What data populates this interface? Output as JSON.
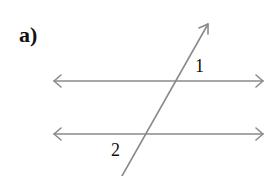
{
  "figure": {
    "part_label": "a)",
    "angle_labels": {
      "angle_1": "1",
      "angle_2": "2"
    },
    "colors": {
      "line": "#8a8a8a",
      "text": "#111111",
      "background": "#ffffff"
    },
    "lines": {
      "parallel_top": {
        "x1": 54,
        "y1": 81,
        "x2": 263,
        "y2": 81,
        "arrows": "both"
      },
      "parallel_bottom": {
        "x1": 54,
        "y1": 134,
        "x2": 263,
        "y2": 134,
        "arrows": "both"
      },
      "transversal": {
        "x1": 122,
        "y1": 176,
        "x2": 208,
        "y2": 24,
        "arrows": "top"
      }
    }
  }
}
